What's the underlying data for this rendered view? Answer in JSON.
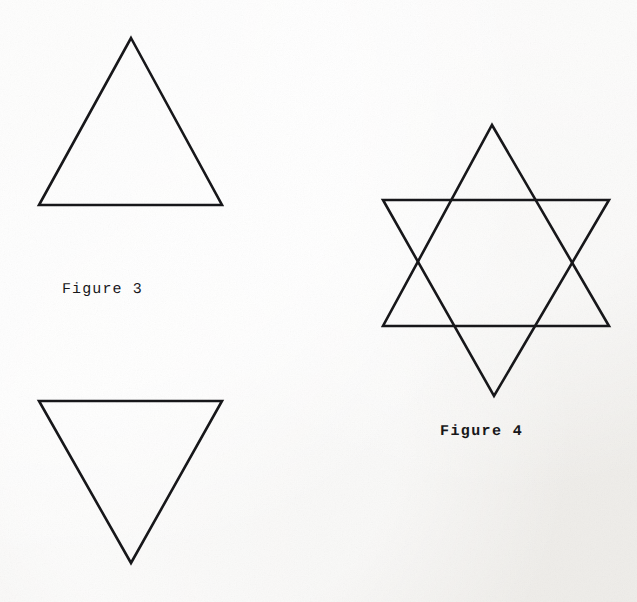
{
  "page": {
    "kind": "scanned-figure-plate",
    "background_color": "#f6f5f3",
    "ink_color": "#17171a",
    "width": 637,
    "height": 602
  },
  "figures": [
    {
      "id": "figure-3",
      "caption": "Figure 3",
      "description": "Two separate equilateral triangles, one pointing up and one pointing down",
      "shapes": [
        {
          "name": "upward-triangle",
          "orientation": "up",
          "points": "131,38 222,205 39,205"
        },
        {
          "name": "downward-triangle",
          "orientation": "down",
          "points": "39,401 222,401 131,563"
        }
      ]
    },
    {
      "id": "figure-4",
      "caption": "Figure 4",
      "description": "Hexagram (Star of David) formed by the same two triangles overlapped",
      "shapes": [
        {
          "name": "star-upward-triangle",
          "orientation": "up",
          "points": "492,125 609,326 383,326"
        },
        {
          "name": "star-downward-triangle",
          "orientation": "down",
          "points": "383,200 609,200 494,396"
        }
      ]
    }
  ],
  "drawing": {
    "stroke_color": "#17171a",
    "stroke_width": 2.6,
    "fill": "none"
  }
}
